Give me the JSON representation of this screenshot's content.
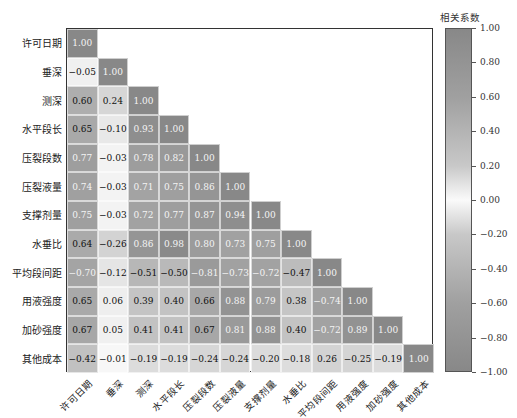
{
  "chart_data": {
    "type": "heatmap",
    "title": "",
    "subtitle": "",
    "variables": [
      "许可日期",
      "垂深",
      "测深",
      "水平段长",
      "压裂段数",
      "压裂液量",
      "支撑剂量",
      "水垂比",
      "平均段间距",
      "用液强度",
      "加砂强度",
      "其他成本"
    ],
    "matrix_lower_triangle": [
      [
        "1.00"
      ],
      [
        "-0.05",
        "1.00"
      ],
      [
        "0.60",
        "0.24",
        "1.00"
      ],
      [
        "0.65",
        "-0.10",
        "0.93",
        "1.00"
      ],
      [
        "0.77",
        "-0.03",
        "0.78",
        "0.82",
        "1.00"
      ],
      [
        "0.74",
        "-0.03",
        "0.71",
        "0.75",
        "0.86",
        "1.00"
      ],
      [
        "0.75",
        "-0.03",
        "0.72",
        "0.77",
        "0.87",
        "0.94",
        "1.00"
      ],
      [
        "0.64",
        "-0.26",
        "0.86",
        "0.98",
        "0.80",
        "0.73",
        "0.75",
        "1.00"
      ],
      [
        "-0.70",
        "-0.12",
        "-0.51",
        "-0.50",
        "-0.81",
        "-0.73",
        "-0.72",
        "-0.47",
        "1.00"
      ],
      [
        "0.65",
        "0.06",
        "0.39",
        "0.40",
        "0.66",
        "0.88",
        "0.79",
        "0.38",
        "-0.74",
        "1.00"
      ],
      [
        "0.67",
        "0.05",
        "0.41",
        "0.41",
        "0.67",
        "0.81",
        "0.88",
        "0.40",
        "-0.72",
        "0.89",
        "1.00"
      ],
      [
        "-0.42",
        "-0.01",
        "-0.19",
        "-0.19",
        "-0.24",
        "-0.24",
        "-0.20",
        "-0.18",
        "0.26",
        "-0.25",
        "-0.19",
        "1.00"
      ]
    ],
    "colorbar": {
      "title": "相关系数",
      "range": [
        -1.0,
        1.0
      ],
      "ticks": [
        "1.00",
        "0.80",
        "0.60",
        "0.40",
        "0.20",
        "0.00",
        "-0.20",
        "-0.40",
        "-0.60",
        "-0.80",
        "-1.00"
      ]
    },
    "colors": {
      "high_abs": "#888888",
      "zero": "#ffffff",
      "frame": "#333333"
    },
    "grid": false,
    "legend_position": "right"
  }
}
